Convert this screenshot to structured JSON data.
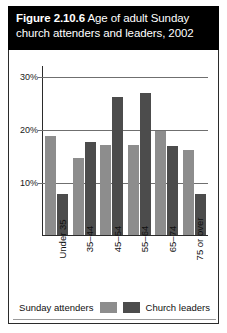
{
  "figure": {
    "title_prefix": "Figure 2.10.6",
    "title_rest": " Age of adult Sunday",
    "title_line2": "church attenders and leaders, 2002"
  },
  "legend": {
    "attenders_label": "Sunday attenders",
    "leaders_label": "Church leaders",
    "attenders_color": "#8d8d8d",
    "leaders_color": "#4c4c4c"
  },
  "axis": {
    "yticks": [
      "30%",
      "20%",
      "10%"
    ],
    "ytick_values": [
      30,
      20,
      10
    ]
  },
  "chart_data": {
    "type": "bar",
    "title": "Figure 2.10.6 Age of adult Sunday church attenders and leaders, 2002",
    "xlabel": "",
    "ylabel": "",
    "ylim": [
      0,
      32
    ],
    "grid": true,
    "legend_position": "bottom",
    "categories": [
      "Under 35",
      "35–44",
      "45–54",
      "55–64",
      "65–74",
      "75 or over"
    ],
    "series": [
      {
        "name": "Sunday attenders",
        "color": "#8d8d8d",
        "values": [
          18.7,
          14.5,
          17.0,
          17.0,
          19.5,
          16.0
        ]
      },
      {
        "name": "Church leaders",
        "color": "#4c4c4c",
        "values": [
          7.8,
          17.5,
          26.0,
          26.8,
          16.8,
          7.8
        ]
      }
    ]
  }
}
